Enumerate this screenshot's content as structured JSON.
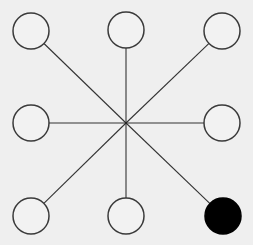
{
  "diagram": {
    "type": "star-graph",
    "canvas": {
      "width": 253,
      "height": 245,
      "background": "#efefef"
    },
    "hub": {
      "cx": 126,
      "cy": 123
    },
    "line_color": "#333333",
    "nodes": [
      {
        "id": "top-left",
        "cx": 31,
        "cy": 31,
        "r": 18,
        "filled": false
      },
      {
        "id": "top-center",
        "cx": 126,
        "cy": 30,
        "r": 18,
        "filled": false
      },
      {
        "id": "top-right",
        "cx": 222,
        "cy": 31,
        "r": 18,
        "filled": false
      },
      {
        "id": "middle-left",
        "cx": 31,
        "cy": 123,
        "r": 18,
        "filled": false
      },
      {
        "id": "middle-right",
        "cx": 222,
        "cy": 123,
        "r": 18,
        "filled": false
      },
      {
        "id": "bottom-left",
        "cx": 31,
        "cy": 216,
        "r": 18,
        "filled": false
      },
      {
        "id": "bottom-center",
        "cx": 126,
        "cy": 216,
        "r": 18,
        "filled": false
      },
      {
        "id": "bottom-right",
        "cx": 223,
        "cy": 216,
        "r": 18,
        "filled": true
      }
    ],
    "filled_color": "#000000",
    "empty_fill": "#f2f2f2",
    "stroke_color": "#3a3a3a"
  }
}
